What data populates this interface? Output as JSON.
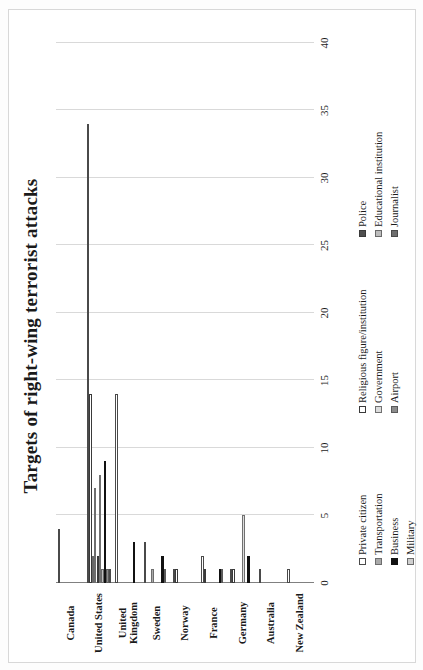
{
  "chart_data": {
    "type": "bar",
    "orientation": "horizontal",
    "title": "Targets of right-wing terrorist attacks",
    "xlabel": "",
    "ylabel": "",
    "xlim": [
      0,
      40
    ],
    "grid": true,
    "legend_position": "bottom",
    "tick_labels": [
      "0",
      "5",
      "10",
      "15",
      "20",
      "25",
      "30",
      "35",
      "40"
    ],
    "tick_values": [
      0,
      5,
      10,
      15,
      20,
      25,
      30,
      35,
      40
    ],
    "categories": [
      "Canada",
      "United States",
      "United\nKingdom",
      "Sweden",
      "Norway",
      "France",
      "Germany",
      "Australia",
      "New Zealand"
    ],
    "series": [
      {
        "name": "Private citizen",
        "color": "#ffffff",
        "values": [
          4,
          34,
          14,
          3,
          1,
          2,
          1,
          1,
          1
        ]
      },
      {
        "name": "Religious figure/institution",
        "color": "#ffffff",
        "values": [
          0,
          14,
          0,
          0,
          1,
          1,
          1,
          0,
          0
        ]
      },
      {
        "name": "Military",
        "color": "#a9a9a9",
        "values": [
          0,
          2,
          0,
          0,
          0,
          0,
          0,
          0,
          0
        ]
      },
      {
        "name": "Transportation",
        "color": "#a9a9a9",
        "values": [
          0,
          7,
          0,
          1,
          0,
          0,
          0,
          0,
          0
        ]
      },
      {
        "name": "Police",
        "color": "#4f4f4f",
        "values": [
          0,
          2,
          0,
          0,
          0,
          0,
          0,
          0,
          0
        ]
      },
      {
        "name": "Government",
        "color": "#dcdcdc",
        "values": [
          0,
          8,
          0,
          0,
          0,
          0,
          5,
          0,
          0
        ]
      },
      {
        "name": "Educational institution",
        "color": "#bdbdbd",
        "values": [
          0,
          1,
          0,
          0,
          0,
          0,
          0,
          0,
          0
        ]
      },
      {
        "name": "Business",
        "color": "#111111",
        "values": [
          0,
          9,
          3,
          2,
          0,
          1,
          2,
          0,
          0
        ]
      },
      {
        "name": "Airport",
        "color": "#8c8c8c",
        "values": [
          0,
          1,
          0,
          1,
          0,
          1,
          0,
          0,
          0
        ]
      },
      {
        "name": "Journalist",
        "color": "#6e6e6e",
        "values": [
          0,
          1,
          0,
          0,
          0,
          0,
          0,
          0,
          0
        ]
      }
    ]
  },
  "legend": {
    "items": [
      {
        "label": "Private citizen",
        "swatch": "s0"
      },
      {
        "label": "Religious figure/institution",
        "swatch": "s3"
      },
      {
        "label": "Police",
        "swatch": "s6"
      },
      {
        "label": "Transportation",
        "swatch": "s1"
      },
      {
        "label": "Government",
        "swatch": "s4"
      },
      {
        "label": "Educational institution",
        "swatch": "s8"
      },
      {
        "label": "Business",
        "swatch": "s2"
      },
      {
        "label": "Airport",
        "swatch": "s5"
      },
      {
        "label": "Journalist",
        "swatch": "s9"
      },
      {
        "label": "Military",
        "swatch": "s7"
      }
    ]
  }
}
